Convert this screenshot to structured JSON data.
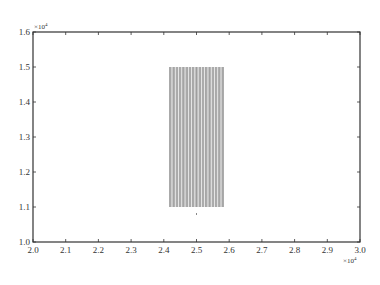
{
  "chart_data": {
    "type": "line",
    "title": "",
    "xlabel": "",
    "ylabel": "",
    "xlim": [
      20000,
      30000
    ],
    "ylim": [
      10000,
      16000
    ],
    "x_multiplier": "×10⁴",
    "y_multiplier": "×10⁴",
    "x_ticks": [
      "2.0",
      "2.1",
      "2.2",
      "2.3",
      "2.4",
      "2.5",
      "2.6",
      "2.7",
      "2.8",
      "2.9",
      "3.0"
    ],
    "y_ticks": [
      "1.0",
      "1.1",
      "1.2",
      "1.3",
      "1.4",
      "1.5",
      "1.6"
    ],
    "grid": false,
    "legend": null,
    "series": [
      {
        "name": "vertical lines",
        "color": "#444444",
        "description": "Dense set of vertical line segments from y=11000 to y=15000",
        "x_positions": [
          24200,
          24300,
          24400,
          24500,
          24600,
          24700,
          24800,
          24900,
          25000,
          25100,
          25200,
          25300,
          25400,
          25500,
          25600,
          25700,
          25800
        ],
        "y_range": [
          11000,
          15000
        ]
      },
      {
        "name": "point",
        "color": "#888888",
        "x": [
          25000
        ],
        "y": [
          10800
        ]
      }
    ]
  },
  "labels": {
    "y_exponent_base": "×10",
    "y_exponent_power": "4",
    "x_exponent_base": "×10",
    "x_exponent_power": "4"
  }
}
